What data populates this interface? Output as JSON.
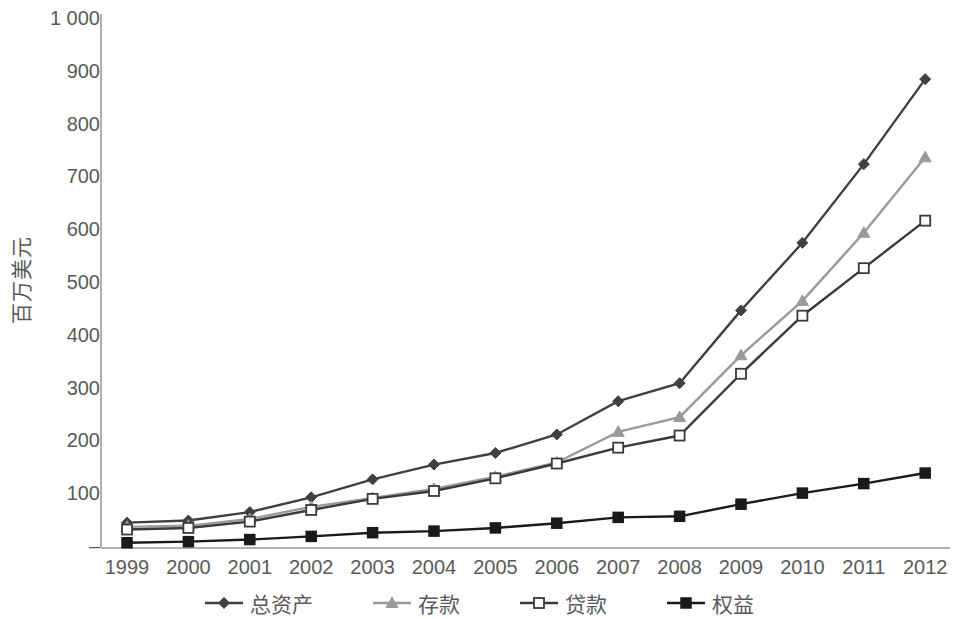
{
  "chart_data": {
    "type": "line",
    "title": "",
    "xlabel": "",
    "ylabel": "百万美元",
    "categories": [
      "1999",
      "2000",
      "2001",
      "2002",
      "2003",
      "2004",
      "2005",
      "2006",
      "2007",
      "2008",
      "2009",
      "2010",
      "2011",
      "2012"
    ],
    "ylim": [
      0,
      1000
    ],
    "ytick_labels": [
      "1 000",
      "900",
      "800",
      "700",
      "600",
      "500",
      "400",
      "300",
      "200",
      "100",
      "–"
    ],
    "ytick_values": [
      1000,
      900,
      800,
      700,
      600,
      500,
      400,
      300,
      200,
      100,
      0
    ],
    "grid": false,
    "legend_position": "bottom",
    "series": [
      {
        "name": "总资产",
        "marker": "diamond",
        "color": "#404040",
        "values": [
          48,
          52,
          68,
          96,
          130,
          158,
          180,
          215,
          278,
          312,
          450,
          578,
          727,
          888
        ]
      },
      {
        "name": "存款",
        "marker": "triangle",
        "color": "#9a9a9a",
        "values": [
          40,
          42,
          55,
          78,
          95,
          112,
          135,
          162,
          220,
          248,
          365,
          468,
          597,
          740
        ]
      },
      {
        "name": "贷款",
        "marker": "square-open",
        "color": "#3a3a3a",
        "values": [
          35,
          38,
          50,
          72,
          93,
          108,
          132,
          160,
          190,
          213,
          330,
          440,
          530,
          620
        ]
      },
      {
        "name": "权益",
        "marker": "square-filled",
        "color": "#1a1a1a",
        "values": [
          10,
          12,
          16,
          22,
          29,
          32,
          38,
          47,
          58,
          60,
          83,
          104,
          122,
          142
        ]
      }
    ]
  },
  "axis": {
    "y_title": "百万美元"
  },
  "legend": {
    "items": [
      {
        "label": "总资产"
      },
      {
        "label": "存款"
      },
      {
        "label": "贷款"
      },
      {
        "label": "权益"
      }
    ]
  }
}
